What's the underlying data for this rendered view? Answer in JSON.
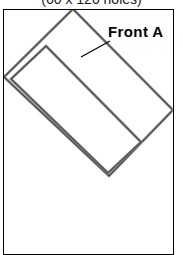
{
  "figure": {
    "caption": "(60 x 120 holes)",
    "label": "Front A",
    "panel": {
      "name": "drawing-sheet",
      "border_color": "#000000",
      "background_color": "#ffffff"
    },
    "part": {
      "name": "rotated-rectangular-frame",
      "outline_color": "#8c8c8c",
      "outline_highlight": "#4d4d4d",
      "fill_color": "#ffffff",
      "rotation_degrees": -37,
      "outer_corners": [
        [
          73,
          10
        ],
        [
          172,
          110
        ],
        [
          109,
          175
        ],
        [
          5,
          77
        ]
      ],
      "inner_corners": [
        [
          46,
          47
        ],
        [
          140,
          141
        ],
        [
          108,
          172
        ],
        [
          12,
          79
        ]
      ]
    },
    "leader_line": {
      "name": "callout-leader",
      "color": "#000000",
      "from": [
        108,
        42
      ],
      "to": [
        82,
        56
      ]
    }
  }
}
